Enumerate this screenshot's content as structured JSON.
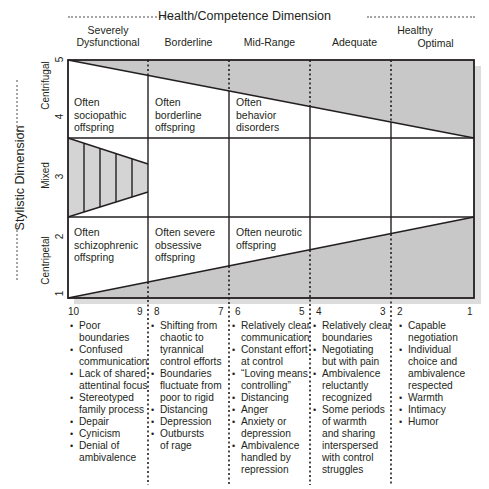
{
  "header": {
    "title": "Health/Competence Dimension",
    "healthy_label": "Healthy"
  },
  "columns": [
    {
      "label": "Severely\nDysfunctional",
      "line1": "Severely",
      "line2": "Dysfunctional",
      "low": "10",
      "high": "9"
    },
    {
      "label": "Borderline",
      "low": "8",
      "high": "7"
    },
    {
      "label": "Mid-Range",
      "low": "6",
      "high": "5"
    },
    {
      "label": "Adequate",
      "low": "4",
      "high": "3"
    },
    {
      "label": "Optimal",
      "low": "2",
      "high": "1"
    }
  ],
  "y_axis": {
    "title": "Stylistic Dimension",
    "ticks": [
      "1",
      "2",
      "3",
      "4",
      "5"
    ],
    "bands": [
      "Centripetal",
      "Mixed",
      "Centrifugal"
    ]
  },
  "cells": {
    "centrifugal": [
      {
        "l1": "Often",
        "l2": "sociopathic",
        "l3": "offspring"
      },
      {
        "l1": "Often",
        "l2": "borderline",
        "l3": "offspring"
      },
      {
        "l1": "Often",
        "l2": "behavior",
        "l3": "disorders"
      }
    ],
    "centripetal": [
      {
        "l1": "Often",
        "l2": "schizophrenic",
        "l3": "offspring"
      },
      {
        "l1": "Often severe",
        "l2": "obsessive",
        "l3": "offspring"
      },
      {
        "l1": "Often neurotic",
        "l2": "offspring",
        "l3": ""
      }
    ]
  },
  "lists": [
    [
      "Poor boundaries",
      "Confused\ncommunication",
      "Lack of shared\nattentinal focus",
      "Stereotyped\nfamily process",
      "Depair",
      "Cynicism",
      "Denial of\nambivalence"
    ],
    [
      "Shifting from\nchaotic to\ntyrannical\ncontrol efforts",
      "Boundaries\nfluctuate from\npoor to rigid",
      "Distancing",
      "Depression",
      "Outbursts\nof rage"
    ],
    [
      "Relatively clear\ncommunication",
      "Constant effort\nat control",
      "“Loving means\ncontrolling”",
      "Distancing",
      "Anger",
      "Anxiety or\ndepression",
      "Ambivalence\nhandled by\nrepression"
    ],
    [
      "Relatively clear\nboundaries",
      "Negotiating\nbut with pain",
      "Ambivalence\nreluctantly\nrecognized",
      "Some periods\nof warmth\nand sharing\ninterspersed\nwith control\nstruggles"
    ],
    [
      "Capable\nnegotiation",
      "Individual\nchoice and\nambivalence\nrespected",
      "Warmth",
      "Intimacy",
      "Humor"
    ]
  ],
  "colors": {
    "shade": "#c8c8c8",
    "shadow": "#dcdcdc",
    "line": "#231f20",
    "dots": "#a6a6a6"
  }
}
